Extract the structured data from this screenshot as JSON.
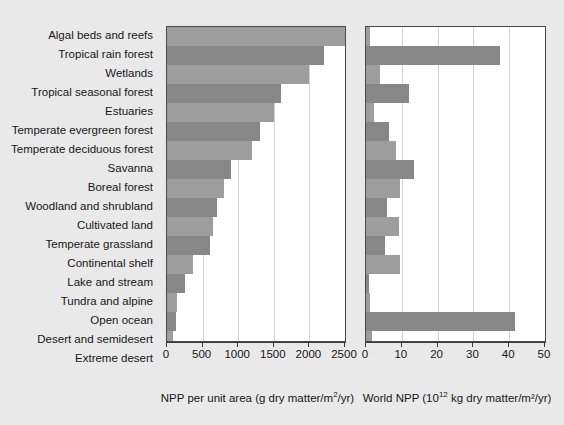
{
  "chart_data": {
    "type": "bar",
    "title": "",
    "orientation": "horizontal",
    "categories": [
      "Algal beds and reefs",
      "Tropical rain forest",
      "Wetlands",
      "Tropical seasonal forest",
      "Estuaries",
      "Temperate evergreen forest",
      "Temperate deciduous forest",
      "Savanna",
      "Boreal forest",
      "Woodland and shrubland",
      "Cultivated land",
      "Temperate grassland",
      "Continental shelf",
      "Lake and stream",
      "Tundra and alpine",
      "Open ocean",
      "Desert and semidesert",
      "Extreme desert"
    ],
    "panels": [
      {
        "name": "npp-per-unit-area",
        "xlabel": "NPP per unit area (g dry matter/m²/yr)",
        "xlabel_parts": {
          "pre": "NPP per unit area (g dry matter/m",
          "sup": "2",
          "post": "/yr)"
        },
        "xlim": [
          0,
          2500
        ],
        "xticks": [
          0,
          500,
          1000,
          1500,
          2000,
          2500
        ],
        "ticklabels": [
          "0",
          "500",
          "1000",
          "1500",
          "2000",
          "2500"
        ],
        "values": [
          2500,
          2200,
          2000,
          1600,
          1500,
          1300,
          1200,
          900,
          800,
          700,
          650,
          600,
          360,
          250,
          140,
          125,
          90,
          3
        ]
      },
      {
        "name": "world-npp",
        "xlabel": "World NPP (10¹² kg dry matter/m²/yr)",
        "xlabel_parts": {
          "pre": "World NPP (10",
          "sup": "12",
          "post": " kg dry matter/m²/yr)"
        },
        "xlim": [
          0,
          50
        ],
        "xticks": [
          0,
          10,
          20,
          30,
          40,
          50
        ],
        "ticklabels": [
          "0",
          "10",
          "20",
          "30",
          "40",
          "50"
        ],
        "values": [
          1.1,
          37.4,
          4.0,
          12.0,
          2.1,
          6.5,
          8.4,
          13.5,
          9.6,
          6.0,
          9.1,
          5.4,
          9.6,
          0.8,
          1.1,
          41.5,
          1.6,
          0.1
        ]
      }
    ],
    "grid": true,
    "legend": "none",
    "colors": {
      "bar_light": "#9d9d9d",
      "bar_dark": "#878787",
      "panel_background": "#ffffff",
      "page_background": "#e9e9e9",
      "axis": "#3a3a3a",
      "gridline": "#d2d2d2"
    }
  }
}
